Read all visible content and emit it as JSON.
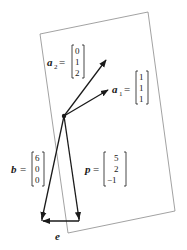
{
  "diagram": {
    "colors": {
      "plane_edge": "#8a8a8a",
      "vector": "#1a1a1a",
      "text": "#1a1a1a",
      "background": "#ffffff"
    },
    "plane": {
      "corners": [
        [
          40,
          34
        ],
        [
          148,
          12
        ],
        [
          175,
          211
        ],
        [
          68,
          233
        ]
      ]
    },
    "origin": [
      64,
      116
    ],
    "vectors": {
      "a2": {
        "name": "a",
        "subscript": "2",
        "equals": "=",
        "components": [
          "0",
          "1",
          "2"
        ],
        "tip": [
          106,
          60
        ]
      },
      "a1": {
        "name": "a",
        "subscript": "1",
        "equals": "=",
        "components": [
          "1",
          "1",
          "1"
        ],
        "tip": [
          108,
          90
        ]
      },
      "b": {
        "name": "b",
        "equals": "=",
        "components": [
          "6",
          "0",
          "0"
        ],
        "tip": [
          42,
          219
        ]
      },
      "p": {
        "name": "p",
        "equals": "=",
        "components": [
          "5",
          "2",
          "−1"
        ],
        "tip": [
          79,
          219
        ]
      },
      "e": {
        "name": "e",
        "from": [
          79,
          221
        ],
        "to": [
          42,
          221
        ]
      }
    }
  }
}
